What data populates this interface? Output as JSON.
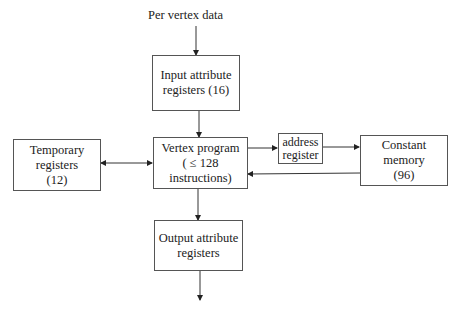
{
  "input_label": "Per vertex data",
  "boxes": {
    "input": {
      "lines": [
        "Input attribute",
        "registers (16)"
      ]
    },
    "vertex": {
      "lines": [
        "Vertex program",
        "( ≤ 128",
        "instructions)"
      ]
    },
    "temporary": {
      "lines": [
        "Temporary",
        "registers",
        "(12)"
      ]
    },
    "address": {
      "lines": [
        "address",
        "register"
      ]
    },
    "constant": {
      "lines": [
        "Constant",
        "memory",
        "(96)"
      ]
    },
    "output": {
      "lines": [
        "Output attribute",
        "registers"
      ]
    }
  }
}
